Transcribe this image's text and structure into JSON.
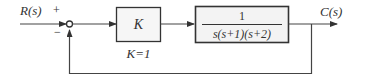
{
  "diagram": {
    "type": "feedback-control-block-diagram",
    "input_label": "R(s)",
    "output_label": "C(s)",
    "summing_junction": {
      "plus_sign": "+",
      "minus_sign": "−"
    },
    "controller_block": {
      "label": "K",
      "annotation": "K=1"
    },
    "plant_block": {
      "numerator": "1",
      "denominator": "s(s+1)(s+2)"
    },
    "feedback": "unity negative feedback",
    "colors": {
      "line": "#444444",
      "block_fill": "#f4f4f4",
      "block_border": "#333333"
    }
  }
}
